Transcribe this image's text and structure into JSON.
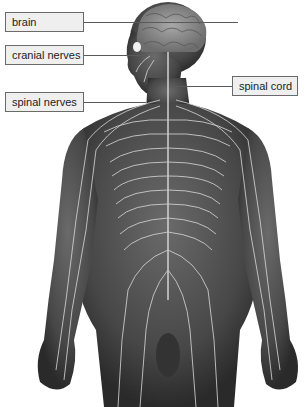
{
  "figure": {
    "labels": [
      {
        "id": "brain",
        "text": "brain",
        "x": 5,
        "y": 12,
        "w": 64,
        "line_to": 238,
        "line_y": 22
      },
      {
        "id": "cranial-nerves",
        "text": "cranial nerves",
        "x": 5,
        "y": 45,
        "w": 64,
        "line_to": 148,
        "line_y": 55
      },
      {
        "id": "spinal-nerves",
        "text": "spinal nerves",
        "x": 5,
        "y": 92,
        "w": 64,
        "line_to": 146,
        "line_y": 102
      },
      {
        "id": "spinal-cord",
        "text": "spinal cord",
        "x": 232,
        "y": 76,
        "w": 52,
        "line_from": 169,
        "line_y": 86
      }
    ],
    "colors": {
      "background": "#ffffff",
      "label_fill": "#efefef",
      "label_border": "#6a6a6a",
      "body": "#4a4a4a",
      "body_dark": "#2e2e2e",
      "nerves": "#d8d8d8"
    }
  }
}
